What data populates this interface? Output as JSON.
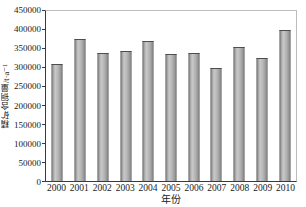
{
  "chart_data": {
    "type": "bar",
    "title": "",
    "xlabel": "年份",
    "ylabel": "精矿含铜量/t·a⁻¹",
    "categories": [
      "2000",
      "2001",
      "2002",
      "2003",
      "2004",
      "2005",
      "2006",
      "2007",
      "2008",
      "2009",
      "2010"
    ],
    "values": [
      310000,
      375000,
      340000,
      345000,
      370000,
      335000,
      340000,
      300000,
      355000,
      325000,
      400000
    ],
    "ylim": [
      0,
      450000
    ],
    "ytick_step": 50000,
    "yticks": [
      0,
      50000,
      100000,
      150000,
      200000,
      250000,
      300000,
      350000,
      400000,
      450000
    ],
    "ytick_labels": [
      "0",
      "50000",
      "100000",
      "150000",
      "200000",
      "250000",
      "300000",
      "350000",
      "400000",
      "450000"
    ],
    "grid": false,
    "legend": "none",
    "bar_fill_color": "#b0b0b0",
    "bar_edge_color": "#4d4d4d",
    "axis_color": "#3a3a3a",
    "frame_color": "#bdbdbd",
    "background_color": "#ffffff"
  }
}
